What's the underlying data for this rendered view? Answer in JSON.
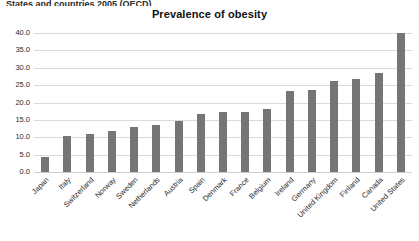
{
  "document": {
    "header_clipped_text": "States and countries 2005 (OECD)"
  },
  "chart_data": {
    "type": "bar",
    "title": "Prevalence of obesity",
    "xlabel": "",
    "ylabel": "",
    "ylim": [
      0,
      40
    ],
    "ytick_step": 5,
    "ytick_labels": [
      "0.0",
      "5.0",
      "10.0",
      "15.0",
      "20.0",
      "25.0",
      "30.0",
      "35.0",
      "40.0"
    ],
    "grid": true,
    "legend": "none",
    "bar_color": "#757575",
    "gridline_color": "#d9d9d9",
    "categories": [
      "Japan",
      "Italy",
      "Switzerland",
      "Norway",
      "Sweden",
      "Netherlands",
      "Austria",
      "Spain",
      "Denmark",
      "France",
      "Belgium",
      "Ireland",
      "Germany",
      "United Kingdom",
      "Finland",
      "Canada",
      "United States"
    ],
    "values": [
      4.3,
      10.3,
      10.9,
      11.8,
      12.9,
      13.4,
      14.8,
      16.6,
      17.2,
      17.3,
      18.2,
      23.2,
      23.5,
      26.2,
      26.9,
      28.5,
      40.0
    ]
  }
}
